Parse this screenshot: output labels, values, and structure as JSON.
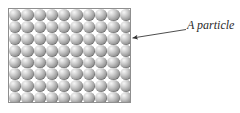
{
  "figure": {
    "type": "particle-packing-diagram",
    "background_color": "#ffffff"
  },
  "particle_box": {
    "name": "particle-container",
    "border_color": "#8f8f8f",
    "fill_color": "#ffffff",
    "columns": 10,
    "rows": 8,
    "particle_count": 80,
    "packing": "square",
    "particle_colors": {
      "highlight": "#f6f6f6",
      "mid": "#a2a2a2",
      "edge": "#6d6d6d"
    }
  },
  "callout": {
    "label": "A particle",
    "line_color": "#3a3a3a",
    "arrow_head": "solid-triangle",
    "points_to": "single particle at right edge of packing"
  }
}
